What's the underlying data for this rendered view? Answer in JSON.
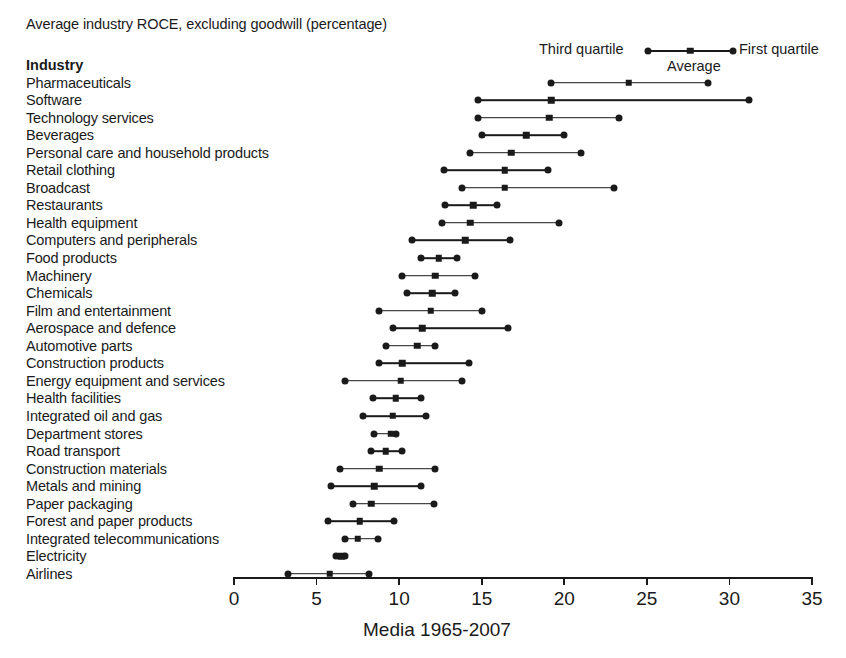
{
  "chart_data": {
    "type": "range_dot_plot",
    "title": "Average industry ROCE, excluding goodwill (percentage)",
    "xlabel": "Media 1965-2007",
    "ylabel": "Industry",
    "xlim": [
      0,
      35
    ],
    "xticks": [
      0,
      5,
      10,
      15,
      20,
      25,
      30,
      35
    ],
    "grid": false,
    "legend": {
      "position": "top-right",
      "left_marker_label": "Third quartile",
      "mid_marker_label": "Average",
      "right_marker_label": "First quartile"
    },
    "series_names": [
      "Third quartile",
      "Average",
      "First quartile"
    ],
    "categories": [
      "Pharmaceuticals",
      "Software",
      "Technology services",
      "Beverages",
      "Personal care and household products",
      "Retail clothing",
      "Broadcast",
      "Restaurants",
      "Health equipment",
      "Computers and peripherals",
      "Food products",
      "Machinery",
      "Chemicals",
      "Film and entertainment",
      "Aerospace and defence",
      "Automotive parts",
      "Construction products",
      "Energy equipment and services",
      "Health facilities",
      "Integrated oil and gas",
      "Department stores",
      "Road transport",
      "Construction materials",
      "Metals and mining",
      "Paper packaging",
      "Forest and paper products",
      "Integrated telecommunications",
      "Electricity",
      "Airlines"
    ],
    "rows": [
      {
        "industry": "Pharmaceuticals",
        "third_quartile": 19.2,
        "average": 23.9,
        "first_quartile": 28.7
      },
      {
        "industry": "Software",
        "third_quartile": 14.8,
        "average": 19.2,
        "first_quartile": 31.2
      },
      {
        "industry": "Technology services",
        "third_quartile": 14.8,
        "average": 19.1,
        "first_quartile": 23.3
      },
      {
        "industry": "Beverages",
        "third_quartile": 15.0,
        "average": 17.7,
        "first_quartile": 20.0
      },
      {
        "industry": "Personal care and household products",
        "third_quartile": 14.3,
        "average": 16.8,
        "first_quartile": 21.0
      },
      {
        "industry": "Retail clothing",
        "third_quartile": 12.7,
        "average": 16.4,
        "first_quartile": 19.0
      },
      {
        "industry": "Broadcast",
        "third_quartile": 13.8,
        "average": 16.4,
        "first_quartile": 23.0
      },
      {
        "industry": "Restaurants",
        "third_quartile": 12.8,
        "average": 14.5,
        "first_quartile": 15.9
      },
      {
        "industry": "Health equipment",
        "third_quartile": 12.6,
        "average": 14.3,
        "first_quartile": 19.7
      },
      {
        "industry": "Computers and peripherals",
        "third_quartile": 10.8,
        "average": 14.0,
        "first_quartile": 16.7
      },
      {
        "industry": "Food products",
        "third_quartile": 11.3,
        "average": 12.4,
        "first_quartile": 13.5
      },
      {
        "industry": "Machinery",
        "third_quartile": 10.2,
        "average": 12.2,
        "first_quartile": 14.6
      },
      {
        "industry": "Chemicals",
        "third_quartile": 10.5,
        "average": 12.0,
        "first_quartile": 13.4
      },
      {
        "industry": "Film and entertainment",
        "third_quartile": 8.8,
        "average": 11.9,
        "first_quartile": 15.0
      },
      {
        "industry": "Aerospace and defence",
        "third_quartile": 9.6,
        "average": 11.4,
        "first_quartile": 16.6
      },
      {
        "industry": "Automotive parts",
        "third_quartile": 9.2,
        "average": 11.1,
        "first_quartile": 12.2
      },
      {
        "industry": "Construction products",
        "third_quartile": 8.8,
        "average": 10.2,
        "first_quartile": 14.2
      },
      {
        "industry": "Energy equipment and services",
        "third_quartile": 6.7,
        "average": 10.1,
        "first_quartile": 13.8
      },
      {
        "industry": "Health facilities",
        "third_quartile": 8.4,
        "average": 9.8,
        "first_quartile": 11.3
      },
      {
        "industry": "Integrated oil and gas",
        "third_quartile": 7.8,
        "average": 9.6,
        "first_quartile": 11.6
      },
      {
        "industry": "Department stores",
        "third_quartile": 8.5,
        "average": 9.5,
        "first_quartile": 9.8
      },
      {
        "industry": "Road transport",
        "third_quartile": 8.3,
        "average": 9.2,
        "first_quartile": 10.2
      },
      {
        "industry": "Construction materials",
        "third_quartile": 6.4,
        "average": 8.8,
        "first_quartile": 12.2
      },
      {
        "industry": "Metals and mining",
        "third_quartile": 5.9,
        "average": 8.5,
        "first_quartile": 11.3
      },
      {
        "industry": "Paper packaging",
        "third_quartile": 7.2,
        "average": 8.3,
        "first_quartile": 12.1
      },
      {
        "industry": "Forest and paper products",
        "third_quartile": 5.7,
        "average": 7.6,
        "first_quartile": 9.7
      },
      {
        "industry": "Integrated telecommunications",
        "third_quartile": 6.7,
        "average": 7.5,
        "first_quartile": 8.7
      },
      {
        "industry": "Electricity",
        "third_quartile": 6.2,
        "average": 6.5,
        "first_quartile": 6.7
      },
      {
        "industry": "Airlines",
        "third_quartile": 3.3,
        "average": 5.8,
        "first_quartile": 8.2
      }
    ]
  },
  "colors": {
    "ink": "#1a1a1a",
    "background": "#ffffff"
  }
}
